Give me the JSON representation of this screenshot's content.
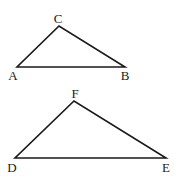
{
  "diagram": {
    "triangles": [
      {
        "name": "ABC",
        "vertices": [
          {
            "label": "A",
            "x": 17,
            "y": 67,
            "label_x": 13,
            "label_y": 80
          },
          {
            "label": "B",
            "x": 125,
            "y": 67,
            "label_x": 125,
            "label_y": 80
          },
          {
            "label": "C",
            "x": 59,
            "y": 26,
            "label_x": 58,
            "label_y": 23
          }
        ]
      },
      {
        "name": "DEF",
        "vertices": [
          {
            "label": "D",
            "x": 15,
            "y": 158,
            "label_x": 12,
            "label_y": 172
          },
          {
            "label": "E",
            "x": 166,
            "y": 158,
            "label_x": 166,
            "label_y": 172
          },
          {
            "label": "F",
            "x": 74,
            "y": 101,
            "label_x": 75,
            "label_y": 98
          }
        ]
      }
    ],
    "color": "#1a1a1a"
  }
}
